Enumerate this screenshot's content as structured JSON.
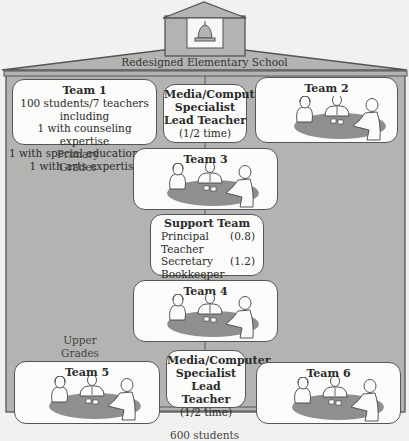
{
  "school": {
    "name": "Redesigned Elementary School",
    "bell_icon": "bell-icon",
    "footer": "600 students"
  },
  "grade_labels": {
    "primary": [
      "Primary",
      "Grades"
    ],
    "upper": [
      "Upper",
      "Grades"
    ]
  },
  "team1": {
    "title": "Team 1",
    "lines": [
      "100 students/7 teachers including",
      "1 with counseling expertise",
      "1 with special education expertise",
      "1 with arts expertise"
    ]
  },
  "media_top": {
    "lines": [
      "Media/Computer",
      "Specialist",
      "Lead Teacher"
    ],
    "note": "(1/2 time)"
  },
  "media_bottom": {
    "lines": [
      "Media/Computer",
      "Specialist",
      "Lead Teacher"
    ],
    "note": "(1/2 time)"
  },
  "teams": [
    {
      "title": "Team 2",
      "scene_icon": "team-meeting-illustration"
    },
    {
      "title": "Team 3",
      "scene_icon": "team-meeting-illustration"
    },
    {
      "title": "Team 4",
      "scene_icon": "team-meeting-illustration"
    },
    {
      "title": "Team 5",
      "scene_icon": "team-meeting-illustration"
    },
    {
      "title": "Team 6",
      "scene_icon": "team-meeting-illustration"
    }
  ],
  "support_team": {
    "title": "Support Team",
    "rows": [
      {
        "role": "Principal Teacher",
        "fte": "(0.8)"
      },
      {
        "role": "Secretary",
        "fte": "(1.2)"
      },
      {
        "role": "Bookkeeper",
        "fte": ""
      },
      {
        "role": "Social Worker",
        "fte": ""
      }
    ]
  },
  "colors": {
    "frame_fill": "#b3b3b1",
    "frame_stroke": "#555555",
    "box_fill": "#fbfbf9",
    "table_fill": "#8f8f8d",
    "background": "#f1f1ef"
  }
}
